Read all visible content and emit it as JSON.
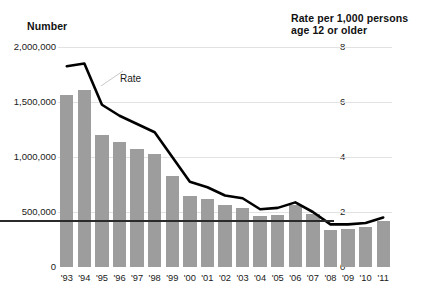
{
  "chart_data": {
    "type": "bar",
    "title": "",
    "subtitle": "",
    "xlabel": "",
    "ylabel": "Number",
    "y2label": "Rate per 1,000 persons\nage 12 or older",
    "grid": true,
    "legend_position": "inline-annotation",
    "categories": [
      "'93",
      "'94",
      "'95",
      "'96",
      "'97",
      "'98",
      "'99",
      "'00",
      "'01",
      "'02",
      "'03",
      "'04",
      "'05",
      "'06",
      "'07",
      "'08",
      "'09",
      "'10",
      "'11"
    ],
    "ylim": [
      0,
      2000000
    ],
    "yticks": [
      0,
      500000,
      1000000,
      1500000,
      2000000
    ],
    "ytick_labels": [
      "0",
      "500,000",
      "1,000,000",
      "1,500,000",
      "2,000,000"
    ],
    "y2lim": [
      0,
      8
    ],
    "y2ticks": [
      0,
      2,
      4,
      6,
      8
    ],
    "y2tick_labels": [
      "0",
      "2",
      "4",
      "6",
      "8"
    ],
    "series": [
      {
        "name": "Number",
        "type": "bar",
        "axis": "left",
        "color": "#9d9d9d",
        "values": [
          1560000,
          1610000,
          1200000,
          1140000,
          1070000,
          1030000,
          830000,
          650000,
          620000,
          560000,
          540000,
          460000,
          470000,
          560000,
          480000,
          340000,
          350000,
          360000,
          420000
        ]
      },
      {
        "name": "Rate",
        "type": "line",
        "axis": "right",
        "color": "#000000",
        "values": [
          7.3,
          7.4,
          5.9,
          5.5,
          5.2,
          4.9,
          4.0,
          3.1,
          2.9,
          2.6,
          2.5,
          2.1,
          2.15,
          2.35,
          2.0,
          1.55,
          1.55,
          1.6,
          1.8
        ]
      }
    ],
    "annotations": [
      {
        "text": "Rate",
        "target_series": "Rate"
      }
    ]
  }
}
